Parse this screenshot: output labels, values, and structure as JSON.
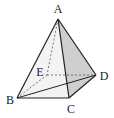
{
  "figure": {
    "type": "pyramid",
    "vertices": {
      "A": {
        "label": "A",
        "x": 58,
        "y": 19,
        "lx": 58,
        "ly": 13
      },
      "B": {
        "label": "B",
        "x": 17,
        "y": 98,
        "lx": 10,
        "ly": 104
      },
      "C": {
        "label": "C",
        "x": 69,
        "y": 98,
        "lx": 71,
        "ly": 113
      },
      "D": {
        "label": "D",
        "x": 96,
        "y": 75,
        "lx": 104,
        "ly": 80
      },
      "E": {
        "label": "E",
        "x": 47,
        "y": 75,
        "lx": 39,
        "ly": 75
      }
    },
    "solid_edges": [
      "AB",
      "AC",
      "AD",
      "BC",
      "CD",
      "BD"
    ],
    "dashed_edges": [
      "AE",
      "BE",
      "ED"
    ],
    "shaded_face": "ACD",
    "colors": {
      "stroke": "#222222",
      "dashed": "#555555",
      "shade": "#c8c8c8",
      "light_shade": "#f0f0f0"
    }
  }
}
